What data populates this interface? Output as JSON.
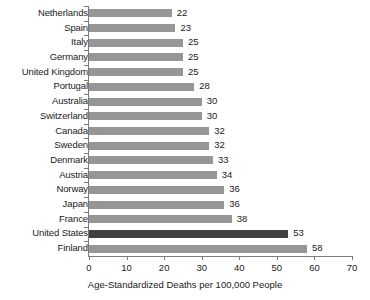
{
  "chart_data": {
    "type": "bar",
    "orientation": "horizontal",
    "title": "",
    "xlabel": "Age-Standardized Deaths per 100,000 People",
    "ylabel": "",
    "xlim": [
      0,
      70
    ],
    "xticks": [
      0,
      10,
      20,
      30,
      40,
      50,
      60,
      70
    ],
    "grid": false,
    "legend": false,
    "categories": [
      "Netherlands",
      "Spain",
      "Italy",
      "Germany",
      "United Kingdom",
      "Portugal",
      "Australia",
      "Switzerland",
      "Canada",
      "Sweden",
      "Denmark",
      "Austria",
      "Norway",
      "Japan",
      "France",
      "United States",
      "Finland"
    ],
    "values": [
      22,
      23,
      25,
      25,
      25,
      28,
      30,
      30,
      32,
      32,
      33,
      34,
      36,
      36,
      38,
      53,
      58
    ],
    "highlighted_category": "United States",
    "colors": {
      "bar": "#969696",
      "bar_highlight": "#404040",
      "axis": "#7a7a7a",
      "text": "#1a1a1a",
      "background": "#ffffff"
    }
  }
}
